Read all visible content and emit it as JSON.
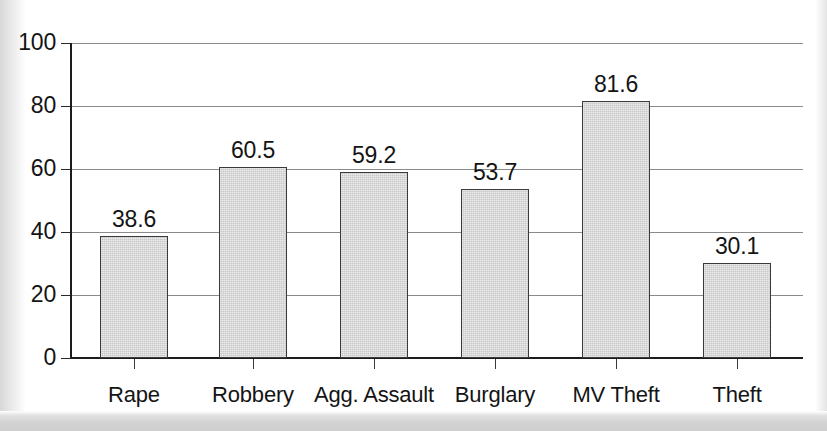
{
  "chart_data": {
    "type": "bar",
    "title": "",
    "subtitle": "",
    "xlabel": "",
    "ylabel": "",
    "categories": [
      "Rape",
      "Robbery",
      "Agg. Assault",
      "Burglary",
      "MV Theft",
      "Theft"
    ],
    "values": [
      38.6,
      60.5,
      59.2,
      53.7,
      81.6,
      30.1
    ],
    "value_labels": [
      "38.6",
      "60.5",
      "59.2",
      "53.7",
      "81.6",
      "30.1"
    ],
    "ylim": [
      0,
      100
    ],
    "ytick_labels": [
      "0",
      "20",
      "40",
      "60",
      "80",
      "100"
    ],
    "ytick_values": [
      0,
      20,
      40,
      60,
      80,
      100
    ],
    "grid": true,
    "grid_axis": "y",
    "legend": false,
    "legend_position": "none",
    "series": [
      {
        "name": "",
        "values": [
          38.6,
          60.5,
          59.2,
          53.7,
          81.6,
          30.1
        ]
      }
    ]
  },
  "style": {
    "bar_fill": "#c9c9c9",
    "bar_border": "#3a3a3a",
    "grid_color": "#8a8a8a",
    "axis_color": "#1c1c1c",
    "text_color": "#141414",
    "background": "#ffffff"
  }
}
